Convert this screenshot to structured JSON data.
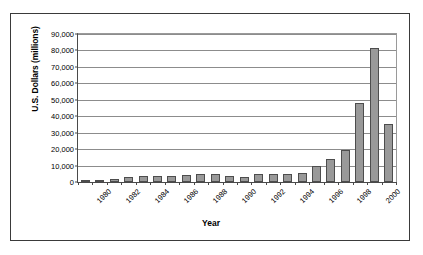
{
  "chart_data": {
    "type": "bar",
    "title": "",
    "xlabel": "Year",
    "ylabel": "U.S. Dollars (millions)",
    "ylim": [
      0,
      90000
    ],
    "ytick_labels": [
      "90,000",
      "80,000",
      "70,000",
      "60,000",
      "50,000",
      "40,000",
      "30,000",
      "20,000",
      "10,000",
      "0"
    ],
    "ytick_values": [
      90000,
      80000,
      70000,
      60000,
      50000,
      40000,
      30000,
      20000,
      10000,
      0
    ],
    "grid": true,
    "legend": "none",
    "bar_color": "#999999",
    "bar_edge_color": "#4d4d4d",
    "categories": [
      1980,
      1981,
      1982,
      1983,
      1984,
      1985,
      1986,
      1987,
      1988,
      1989,
      1990,
      1991,
      1992,
      1993,
      1994,
      1995,
      1996,
      1997,
      1998,
      1999,
      2000,
      2001
    ],
    "xtick_labels": [
      "1980",
      "1982",
      "1984",
      "1986",
      "1988",
      "1990",
      "1992",
      "1994",
      "1996",
      "1998",
      "2000"
    ],
    "values": [
      600,
      1500,
      2000,
      3000,
      3400,
      3500,
      3800,
      4300,
      4900,
      4900,
      3600,
      2900,
      4900,
      4700,
      4800,
      5400,
      10000,
      14000,
      19200,
      48000,
      81800,
      35400
    ]
  }
}
